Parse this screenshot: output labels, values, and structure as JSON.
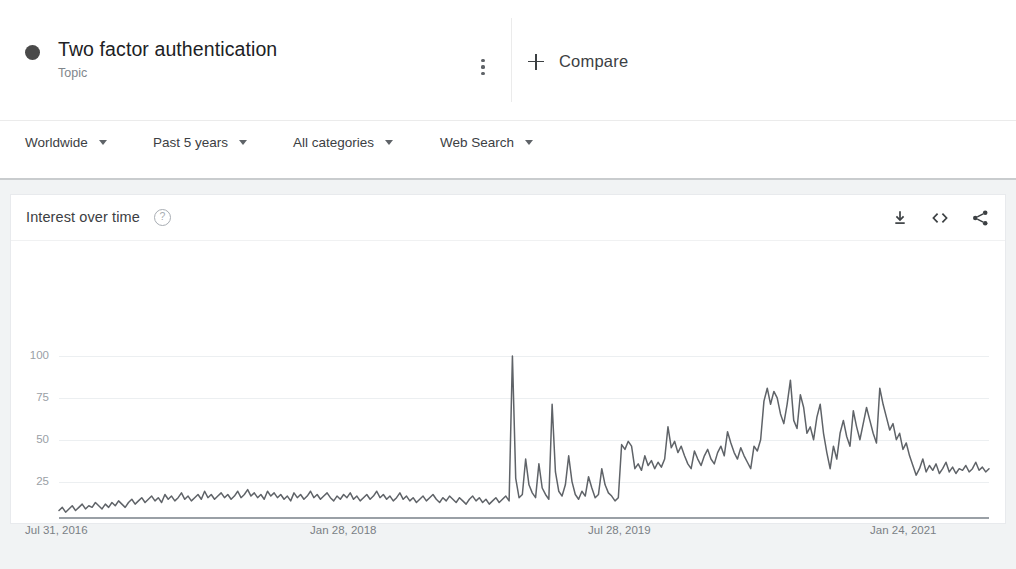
{
  "header": {
    "query_title": "Two factor authentication",
    "query_type": "Topic",
    "series_color": "#4a4a4a",
    "kebab_name": "more-options",
    "compare_label": "Compare"
  },
  "filters": [
    {
      "label": "Worldwide",
      "name": "location"
    },
    {
      "label": "Past 5 years",
      "name": "time-range"
    },
    {
      "label": "All categories",
      "name": "category"
    },
    {
      "label": "Web Search",
      "name": "search-type"
    }
  ],
  "card": {
    "title": "Interest over time",
    "help_icon": "?",
    "actions": [
      {
        "name": "download-icon"
      },
      {
        "name": "embed-icon"
      },
      {
        "name": "share-icon"
      }
    ]
  },
  "chart_data": {
    "type": "line",
    "title": "Interest over time",
    "xlabel": "",
    "ylabel": "",
    "ylim": [
      0,
      100
    ],
    "yticks": [
      100,
      75,
      50,
      25
    ],
    "grid": true,
    "legend_position": "none",
    "line_color": "#5f6368",
    "xtick_labels": [
      "Jul 31, 2016",
      "Jan 28, 2018",
      "Jul 28, 2019",
      "Jan 24, 2021"
    ],
    "xtick_positions": [
      0,
      78,
      156,
      234
    ],
    "x_count": 262,
    "series": [
      {
        "name": "Two factor authentication",
        "values": [
          4,
          6,
          3,
          5,
          7,
          4,
          6,
          8,
          5,
          7,
          6,
          9,
          7,
          5,
          8,
          6,
          9,
          7,
          10,
          8,
          6,
          9,
          11,
          8,
          10,
          12,
          9,
          11,
          13,
          10,
          12,
          9,
          14,
          11,
          13,
          10,
          12,
          15,
          11,
          13,
          10,
          12,
          14,
          11,
          16,
          12,
          14,
          11,
          13,
          15,
          12,
          14,
          11,
          13,
          16,
          12,
          14,
          17,
          13,
          15,
          12,
          14,
          11,
          16,
          13,
          15,
          12,
          14,
          11,
          13,
          10,
          15,
          12,
          14,
          11,
          13,
          16,
          12,
          14,
          11,
          13,
          15,
          12,
          10,
          13,
          11,
          14,
          12,
          15,
          11,
          13,
          10,
          12,
          14,
          11,
          13,
          16,
          12,
          14,
          11,
          13,
          10,
          12,
          15,
          11,
          13,
          10,
          12,
          9,
          11,
          13,
          10,
          12,
          14,
          11,
          9,
          12,
          10,
          13,
          11,
          9,
          12,
          10,
          8,
          11,
          13,
          10,
          12,
          9,
          11,
          8,
          10,
          12,
          9,
          11,
          13,
          10,
          100,
          24,
          12,
          14,
          36,
          20,
          15,
          12,
          33,
          18,
          14,
          11,
          70,
          28,
          16,
          13,
          20,
          38,
          22,
          14,
          11,
          16,
          13,
          25,
          18,
          12,
          14,
          30,
          20,
          15,
          13,
          10,
          12,
          45,
          42,
          47,
          44,
          30,
          33,
          29,
          38,
          32,
          35,
          30,
          34,
          31,
          36,
          56,
          43,
          47,
          40,
          44,
          38,
          33,
          30,
          41,
          36,
          32,
          38,
          42,
          36,
          33,
          40,
          44,
          38,
          53,
          46,
          40,
          36,
          43,
          38,
          34,
          30,
          44,
          41,
          48,
          72,
          80,
          70,
          78,
          74,
          64,
          58,
          70,
          85,
          60,
          55,
          76,
          68,
          52,
          56,
          48,
          62,
          70,
          52,
          40,
          30,
          44,
          36,
          52,
          60,
          50,
          44,
          66,
          56,
          48,
          58,
          68,
          60,
          52,
          46,
          80,
          70,
          62,
          54,
          58,
          48,
          52,
          42,
          46,
          38,
          32,
          26,
          30,
          36,
          28,
          32,
          29,
          33,
          27,
          30,
          34,
          28,
          31,
          27,
          30,
          29,
          32,
          28,
          30,
          34,
          29,
          31,
          28,
          30
        ]
      }
    ]
  }
}
